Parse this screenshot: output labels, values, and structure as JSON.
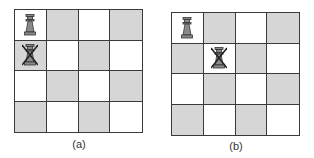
{
  "figure": {
    "colors": {
      "light_square": "#ffffff",
      "dark_square": "#d6d6d6",
      "grid_line": "#3a3a3a",
      "piece_fill": "#8a8a8a",
      "piece_outline": "#333333",
      "cross": "#222222"
    },
    "boards": [
      {
        "caption": "(a)",
        "size": 4,
        "squares": [
          [
            "white",
            "gray",
            "white",
            "gray"
          ],
          [
            "gray",
            "white",
            "gray",
            "white"
          ],
          [
            "white",
            "gray",
            "white",
            "gray"
          ],
          [
            "gray",
            "white",
            "gray",
            "white"
          ]
        ],
        "pieces": [
          {
            "type": "queen",
            "row": 0,
            "col": 0,
            "crossed": false
          },
          {
            "type": "queen",
            "row": 1,
            "col": 0,
            "crossed": true
          }
        ]
      },
      {
        "caption": "(b)",
        "size": 4,
        "squares": [
          [
            "white",
            "gray",
            "white",
            "gray"
          ],
          [
            "gray",
            "white",
            "gray",
            "white"
          ],
          [
            "white",
            "gray",
            "white",
            "gray"
          ],
          [
            "gray",
            "white",
            "gray",
            "white"
          ]
        ],
        "pieces": [
          {
            "type": "queen",
            "row": 0,
            "col": 0,
            "crossed": false
          },
          {
            "type": "queen",
            "row": 1,
            "col": 1,
            "crossed": true
          }
        ]
      }
    ]
  }
}
